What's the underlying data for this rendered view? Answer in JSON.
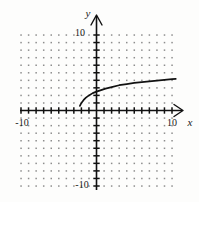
{
  "figure": {
    "kind": "coordinate-plane-graph",
    "background_color": "#fdfdfc",
    "ink_color": "#111111",
    "grid_dot_color": "#8d8d8d"
  },
  "axes": {
    "x_axis_label": "x",
    "y_axis_label": "y",
    "x_tick_labels": [
      "-10",
      "10"
    ],
    "y_tick_labels": [
      "10",
      "-10"
    ],
    "x_left_label": "-10",
    "x_right_label": "10",
    "y_top_label": "10",
    "y_bottom_label": "-10"
  },
  "chart_data": {
    "type": "line",
    "title": "",
    "xlabel": "x",
    "ylabel": "y",
    "xlim": [
      -10,
      10
    ],
    "ylim": [
      -10,
      10
    ],
    "xticks": [
      -10,
      -9,
      -8,
      -7,
      -6,
      -5,
      -4,
      -3,
      -2,
      -1,
      0,
      1,
      2,
      3,
      4,
      5,
      6,
      7,
      8,
      9,
      10
    ],
    "yticks": [
      -10,
      -9,
      -8,
      -7,
      -6,
      -5,
      -4,
      -3,
      -2,
      -1,
      0,
      1,
      2,
      3,
      4,
      5,
      6,
      7,
      8,
      9,
      10
    ],
    "xtick_labels_shown": [
      -10,
      10
    ],
    "ytick_labels_shown": [
      -10,
      10
    ],
    "grid": "dotted-lattice-at-integer-points",
    "legend": "none",
    "series": [
      {
        "name": "increasing radical curve",
        "description": "root-type increasing curve beginning near (-2.2, 0.6) and rising slowly to about (10.5, 4.2)",
        "x": [
          -2.2,
          -2.0,
          -1.7,
          -1.4,
          -1.0,
          -0.5,
          0.0,
          0.6,
          1.2,
          2.0,
          3.0,
          4.0,
          5.0,
          6.0,
          7.0,
          8.0,
          9.0,
          10.0,
          10.5
        ],
        "y": [
          0.6,
          1.0,
          1.4,
          1.7,
          2.0,
          2.3,
          2.5,
          2.7,
          2.9,
          3.1,
          3.35,
          3.5,
          3.65,
          3.75,
          3.85,
          3.95,
          4.05,
          4.15,
          4.2
        ]
      }
    ]
  }
}
